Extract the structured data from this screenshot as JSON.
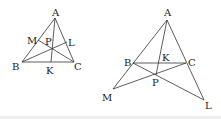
{
  "diagrams": [
    {
      "id": "left",
      "description": "Acute triangle ABC with cevians through interior point P",
      "labels": {
        "A": "A",
        "B": "B",
        "C": "C",
        "K": "K",
        "L": "L",
        "M": "M",
        "P": "P"
      },
      "segments": [
        "AB",
        "BC",
        "CA",
        "AK",
        "BL",
        "CM"
      ]
    },
    {
      "id": "right",
      "description": "Triangle ABC with lines through exterior point P extended to M and L",
      "labels": {
        "A": "A",
        "B": "B",
        "C": "C",
        "K": "K",
        "L": "L",
        "M": "M",
        "P": "P"
      },
      "segments": [
        "AB",
        "BC",
        "CA",
        "AP",
        "BL",
        "CM"
      ]
    }
  ],
  "colors": {
    "stroke": "#333333",
    "text": "#222222",
    "background": "#ffffff"
  }
}
